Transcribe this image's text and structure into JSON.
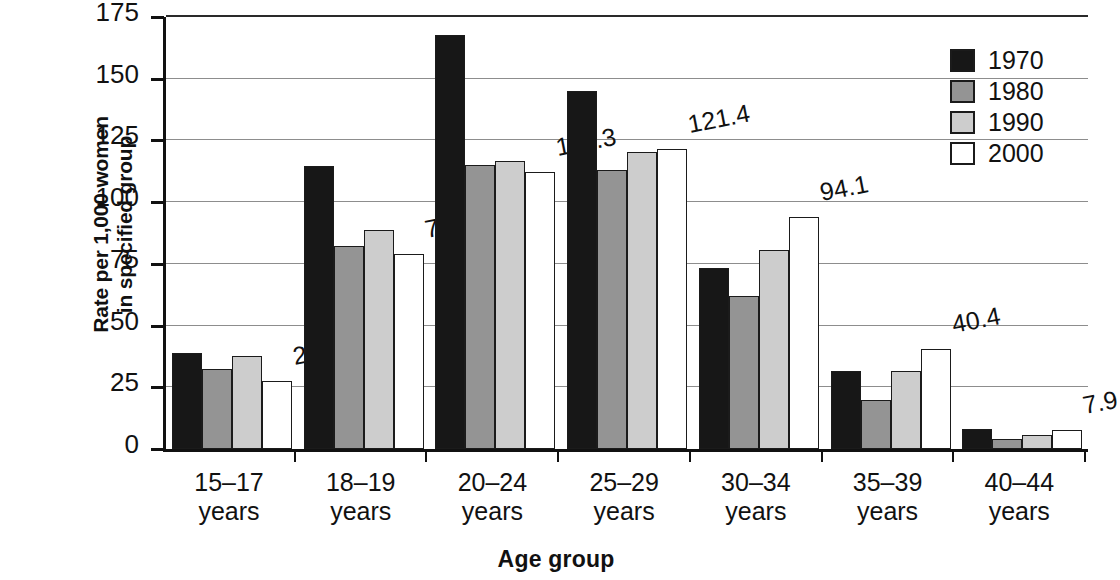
{
  "chart_data": {
    "type": "bar",
    "title": "",
    "xlabel": "Age group",
    "ylabel": "Rate per 1,000 women\nin specified group",
    "ylim": [
      0,
      175
    ],
    "yticks": [
      0,
      25,
      50,
      75,
      100,
      125,
      150,
      175
    ],
    "grid": true,
    "legend_position": "top-right",
    "categories": [
      "15–17\nyears",
      "18–19\nyears",
      "20–24\nyears",
      "25–29\nyears",
      "30–34\nyears",
      "35–39\nyears",
      "40–44\nyears"
    ],
    "series": [
      {
        "name": "1970",
        "values": [
          38.8,
          114.7,
          167.8,
          145.1,
          73.3,
          31.7,
          8.1
        ]
      },
      {
        "name": "1980",
        "values": [
          32.5,
          82.1,
          115.1,
          112.9,
          61.9,
          19.8,
          3.9
        ]
      },
      {
        "name": "1990",
        "values": [
          37.5,
          88.6,
          116.5,
          120.2,
          80.8,
          31.7,
          5.5
        ]
      },
      {
        "name": "2000",
        "values": [
          27.4,
          79.2,
          112.3,
          121.4,
          94.1,
          40.4,
          7.9
        ]
      }
    ],
    "annotations": [
      {
        "text": "27.4",
        "series": "2000",
        "category": "15–17 years"
      },
      {
        "text": "79.2",
        "series": "2000",
        "category": "18–19 years"
      },
      {
        "text": "112.3",
        "series": "2000",
        "category": "20–24 years"
      },
      {
        "text": "121.4",
        "series": "2000",
        "category": "25–29 years"
      },
      {
        "text": "94.1",
        "series": "2000",
        "category": "30–34 years"
      },
      {
        "text": "40.4",
        "series": "2000",
        "category": "35–39 years"
      },
      {
        "text": "7.9",
        "series": "2000",
        "category": "40–44 years"
      }
    ],
    "colors": {
      "1970": "#171717",
      "1980": "#949494",
      "1990": "#cdcdcd",
      "2000": "#ffffff",
      "axis": "#111111",
      "gridline": "#8d8d8d"
    }
  },
  "axes": {
    "y_title": "Rate per 1,000 women\nin specified group",
    "x_title": "Age group",
    "y_tick_labels": [
      "175",
      "150",
      "125",
      "100",
      "75",
      "50",
      "25",
      "0"
    ]
  },
  "legend": {
    "entries": [
      {
        "label": "1970",
        "swatch": "black-swatch"
      },
      {
        "label": "1980",
        "swatch": "dark-gray-swatch"
      },
      {
        "label": "1990",
        "swatch": "light-gray-swatch"
      },
      {
        "label": "2000",
        "swatch": "white-swatch"
      }
    ]
  }
}
